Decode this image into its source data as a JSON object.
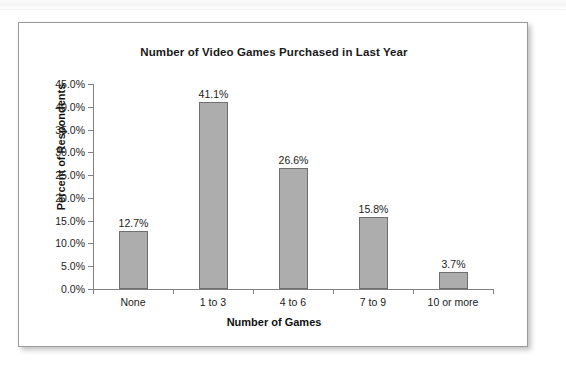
{
  "chart_data": {
    "type": "bar",
    "title": "Number of Video Games Purchased in Last Year",
    "xlabel": "Number of Games",
    "ylabel": "Percent of Respondents",
    "categories": [
      "None",
      "1 to 3",
      "4 to 6",
      "7 to 9",
      "10 or more"
    ],
    "values": [
      12.7,
      41.1,
      26.6,
      15.8,
      3.7
    ],
    "value_labels": [
      "12.7%",
      "41.1%",
      "26.6%",
      "15.8%",
      "3.7%"
    ],
    "ylim": [
      0,
      45
    ],
    "ytick_step": 5,
    "ytick_labels": [
      "0.0%",
      "5.0%",
      "10.0%",
      "15.0%",
      "20.0%",
      "25.0%",
      "30.0%",
      "35.0%",
      "40.0%",
      "45.0%"
    ],
    "ytick_values": [
      0,
      5,
      10,
      15,
      20,
      25,
      30,
      35,
      40,
      45
    ],
    "grid": false,
    "legend": false,
    "legend_position": "none",
    "bar_color": "#adadad",
    "bar_border_color": "#6f6f6f",
    "axis_color": "#808080",
    "frame_border_color": "#9a9a9a",
    "background_color": "#ffffff",
    "text_color": "#1a1a1a"
  }
}
